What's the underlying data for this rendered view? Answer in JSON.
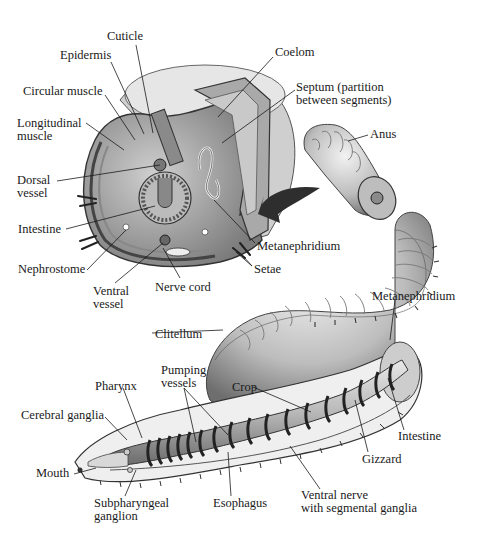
{
  "diagram": {
    "cross_section": {
      "labels": [
        {
          "id": "cuticle",
          "text": "Cuticle",
          "x": 107,
          "y": 30
        },
        {
          "id": "epidermis",
          "text": "Epidermis",
          "x": 60,
          "y": 49
        },
        {
          "id": "circular-muscle",
          "text": "Circular muscle",
          "x": 23,
          "y": 85
        },
        {
          "id": "longitudinal-muscle",
          "text": "Longitudinal\nmuscle",
          "x": 17,
          "y": 117
        },
        {
          "id": "dorsal-vessel",
          "text": "Dorsal\nvessel",
          "x": 17,
          "y": 174
        },
        {
          "id": "intestine-cs",
          "text": "Intestine",
          "x": 18,
          "y": 223
        },
        {
          "id": "nephrostome",
          "text": "Nephrostome",
          "x": 18,
          "y": 263
        },
        {
          "id": "ventral-vessel",
          "text": "Ventral\nvessel",
          "x": 93,
          "y": 285
        },
        {
          "id": "nerve-cord",
          "text": "Nerve cord",
          "x": 155,
          "y": 281
        },
        {
          "id": "coelom",
          "text": "Coelom",
          "x": 275,
          "y": 46
        },
        {
          "id": "septum",
          "text": "Septum (partition\nbetween segments)",
          "x": 296,
          "y": 81
        },
        {
          "id": "metanephridium-cs",
          "text": "Metanephridium",
          "x": 257,
          "y": 240
        },
        {
          "id": "setae",
          "text": "Setae",
          "x": 254,
          "y": 263
        }
      ]
    },
    "whole_worm": {
      "labels": [
        {
          "id": "anus",
          "text": "Anus",
          "x": 370,
          "y": 128
        },
        {
          "id": "clitellum",
          "text": "Clitellum",
          "x": 155,
          "y": 328
        },
        {
          "id": "metanephridium",
          "text": "Metanephridium",
          "x": 372,
          "y": 290
        },
        {
          "id": "pumping-vessels",
          "text": "Pumping\nvessels",
          "x": 161,
          "y": 364
        },
        {
          "id": "crop",
          "text": "Crop",
          "x": 232,
          "y": 381
        },
        {
          "id": "pharynx",
          "text": "Pharynx",
          "x": 95,
          "y": 380
        },
        {
          "id": "cerebral-ganglia",
          "text": "Cerebral ganglia",
          "x": 21,
          "y": 409
        },
        {
          "id": "intestine",
          "text": "Intestine",
          "x": 398,
          "y": 430
        },
        {
          "id": "gizzard",
          "text": "Gizzard",
          "x": 362,
          "y": 453
        },
        {
          "id": "mouth",
          "text": "Mouth",
          "x": 36,
          "y": 467
        },
        {
          "id": "subpharyngeal-ganglion",
          "text": "Subpharyngeal\nganglion",
          "x": 94,
          "y": 497
        },
        {
          "id": "esophagus",
          "text": "Esophagus",
          "x": 213,
          "y": 497
        },
        {
          "id": "ventral-nerve",
          "text": "Ventral nerve\nwith segmental ganglia",
          "x": 301,
          "y": 489
        }
      ]
    },
    "arrow": {
      "direction": "left",
      "meaning": "section location"
    },
    "colors": {
      "ink": "#1a1a1a",
      "body_light": "#d9d9d9",
      "body_mid": "#9a9a9a",
      "body_dark": "#3c3c3c",
      "background": "#ffffff"
    }
  }
}
